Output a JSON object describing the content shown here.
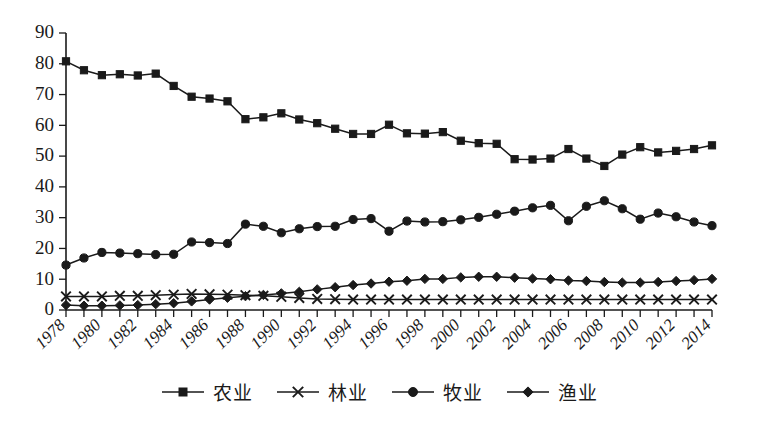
{
  "chart_data": {
    "type": "line",
    "title": "",
    "subtitle": "",
    "xlabel": "",
    "ylabel": "",
    "xlim": [
      1978,
      2014
    ],
    "ylim": [
      0,
      90
    ],
    "ytick_step": 10,
    "grid": false,
    "legend_position": "bottom",
    "yticks": [
      0,
      10,
      20,
      30,
      40,
      50,
      60,
      70,
      80,
      90
    ],
    "x": [
      1978,
      1979,
      1980,
      1981,
      1982,
      1983,
      1984,
      1985,
      1986,
      1987,
      1988,
      1989,
      1990,
      1991,
      1992,
      1993,
      1994,
      1995,
      1996,
      1997,
      1998,
      1999,
      2000,
      2001,
      2002,
      2003,
      2004,
      2005,
      2006,
      2007,
      2008,
      2009,
      2010,
      2011,
      2012,
      2013,
      2014
    ],
    "xtick_labels": [
      "1978",
      "1980",
      "1982",
      "1984",
      "1986",
      "1988",
      "1990",
      "1992",
      "1994",
      "1996",
      "1998",
      "2000",
      "2002",
      "2004",
      "2006",
      "2008",
      "2010",
      "2012",
      "2014"
    ],
    "xtick_label_years": [
      1978,
      1980,
      1982,
      1984,
      1986,
      1988,
      1990,
      1992,
      1994,
      1996,
      1998,
      2000,
      2002,
      2004,
      2006,
      2008,
      2010,
      2012,
      2014
    ],
    "series": [
      {
        "name": "农业",
        "marker": "square",
        "values": [
          80.8,
          77.9,
          76.3,
          76.6,
          76.2,
          76.8,
          72.8,
          69.3,
          68.7,
          67.8,
          62.0,
          62.6,
          63.9,
          61.9,
          60.7,
          58.9,
          57.2,
          57.2,
          60.2,
          57.4,
          57.3,
          57.8,
          55.0,
          54.2,
          54.0,
          49.0,
          48.9,
          49.2,
          52.3,
          49.2,
          46.8,
          50.5,
          52.9,
          51.2,
          51.7,
          52.3,
          53.5
        ]
      },
      {
        "name": "林业",
        "marker": "x",
        "values": [
          4.4,
          4.4,
          4.4,
          4.6,
          4.6,
          4.8,
          5.0,
          5.2,
          5.1,
          5.0,
          4.8,
          4.6,
          4.3,
          3.9,
          3.6,
          3.5,
          3.4,
          3.4,
          3.4,
          3.4,
          3.4,
          3.4,
          3.4,
          3.4,
          3.4,
          3.4,
          3.4,
          3.4,
          3.4,
          3.4,
          3.4,
          3.4,
          3.4,
          3.4,
          3.4,
          3.4,
          3.4
        ]
      },
      {
        "name": "牧业",
        "marker": "circle",
        "values": [
          14.6,
          16.9,
          18.7,
          18.5,
          18.3,
          18.0,
          18.1,
          22.1,
          21.9,
          21.6,
          27.9,
          27.2,
          25.1,
          26.4,
          27.1,
          27.2,
          29.4,
          29.7,
          25.6,
          28.9,
          28.6,
          28.7,
          29.3,
          30.1,
          31.1,
          32.1,
          33.2,
          34.0,
          29.0,
          33.7,
          35.5,
          32.9,
          29.5,
          31.5,
          30.3,
          28.6,
          27.4
        ]
      },
      {
        "name": "渔业",
        "marker": "diamond",
        "values": [
          1.6,
          1.4,
          1.4,
          1.5,
          1.6,
          1.9,
          2.2,
          2.8,
          3.4,
          4.0,
          4.5,
          4.9,
          5.4,
          5.9,
          6.7,
          7.4,
          8.1,
          8.6,
          9.2,
          9.5,
          10.1,
          10.1,
          10.6,
          10.8,
          10.8,
          10.5,
          10.2,
          10.0,
          9.6,
          9.4,
          9.1,
          8.9,
          8.9,
          9.1,
          9.4,
          9.7,
          10.1
        ]
      }
    ]
  },
  "legend": {
    "entries": [
      {
        "label": "农业",
        "marker": "square"
      },
      {
        "label": "林业",
        "marker": "x"
      },
      {
        "label": "牧业",
        "marker": "circle"
      },
      {
        "label": "渔业",
        "marker": "diamond"
      }
    ]
  },
  "colors": {
    "ink": "#1a1a1a",
    "background": "#ffffff"
  }
}
